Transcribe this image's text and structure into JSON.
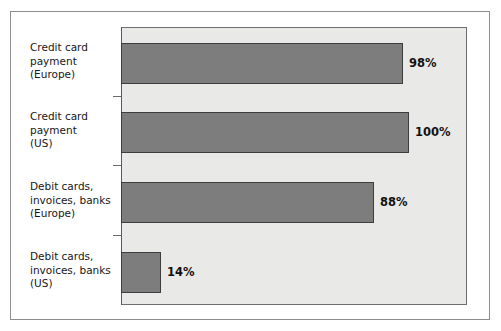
{
  "chart_data": {
    "type": "bar",
    "orientation": "horizontal",
    "title": "",
    "subtitle": "",
    "xlabel": "",
    "ylabel": "",
    "xlim": [
      0,
      120
    ],
    "grid": false,
    "legend": null,
    "categories": [
      "Credit card payment (Europe)",
      "Credit card payment (US)",
      "Debit cards, invoices, banks (Europe)",
      "Debit cards, invoices, banks (US)"
    ],
    "values": [
      98,
      100,
      88,
      14
    ],
    "value_labels": [
      "98%",
      "100%",
      "88%",
      "14%"
    ],
    "bars": [
      {
        "label_line1": "Credit card",
        "label_line2": "payment",
        "label_line3": "(Europe)",
        "value": 98,
        "value_label": "98%"
      },
      {
        "label_line1": "Credit card",
        "label_line2": "payment",
        "label_line3": "(US)",
        "value": 100,
        "value_label": "100%"
      },
      {
        "label_line1": "Debit cards,",
        "label_line2": "invoices, banks",
        "label_line3": "(Europe)",
        "value": 88,
        "value_label": "88%"
      },
      {
        "label_line1": "Debit cards,",
        "label_line2": "invoices, banks",
        "label_line3": "(US)",
        "value": 14,
        "value_label": "14%"
      }
    ],
    "colors": {
      "bar_fill": "#7d7d7d",
      "bar_border": "#3d3d3d",
      "plot_background": "#e9e9e7",
      "plot_border": "#6e6e6e",
      "figure_background": "#ffffff",
      "figure_border": "#8d8d8d",
      "text": "#171717"
    }
  },
  "category_labels": [
    "Credit card\npayment\n(Europe)",
    "Credit card\npayment\n(US)",
    "Debit cards,\ninvoices, banks\n(Europe)",
    "Debit cards,\ninvoices, banks\n(US)"
  ]
}
